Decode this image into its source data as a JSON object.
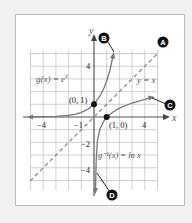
{
  "figure": {
    "axes": {
      "x_label": "x",
      "y_label": "y"
    },
    "x_ticks": [
      {
        "value": -4,
        "label": "−4"
      },
      {
        "value": -1,
        "label": "−1"
      },
      {
        "value": 4,
        "label": "4"
      }
    ],
    "y_ticks": [
      {
        "value": 4,
        "label": "4"
      },
      {
        "value": -2,
        "label": "−2"
      },
      {
        "value": -4,
        "label": "−4"
      }
    ],
    "curves": [
      {
        "name": "g",
        "label": "g(x) = e^x",
        "label_text": "g(x) = e",
        "label_sup": "x"
      },
      {
        "name": "g_inverse",
        "label_text": "g⁻¹(x) = ln x"
      },
      {
        "name": "identity",
        "label_text": "y = x"
      }
    ],
    "points": [
      {
        "label": "(0, 1)",
        "x": 0,
        "y": 1
      },
      {
        "label": "(1, 0)",
        "x": 1,
        "y": 0
      }
    ],
    "callouts": [
      {
        "letter": "A",
        "target": "y = x line"
      },
      {
        "letter": "B",
        "target": "g(x) = e^x curve"
      },
      {
        "letter": "C",
        "target": "ln x curve"
      },
      {
        "letter": "D",
        "target": "ln x asymptote end"
      }
    ],
    "colors": {
      "background": "#f1f1f1",
      "panel": "#ffffff",
      "grid": "#bdbdbd",
      "axis": "#555555",
      "curve": "#777777",
      "dashed": "#8a8a8a",
      "callout": "#111111"
    }
  }
}
